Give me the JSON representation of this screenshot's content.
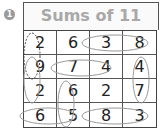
{
  "exercise": {
    "number": "1",
    "title": "Sums of 11"
  },
  "grid": {
    "rows": [
      [
        "2",
        "6",
        "3",
        "8"
      ],
      [
        "9",
        "7",
        "4",
        "4"
      ],
      [
        "2",
        "6",
        "2",
        "7"
      ],
      [
        "6",
        "5",
        "8",
        "3"
      ]
    ]
  },
  "pairs": [
    {
      "cells": [
        "r1c1",
        "r2c1"
      ],
      "values": [
        "2",
        "9"
      ],
      "style": "dashed"
    },
    {
      "cells": [
        "r1c3",
        "r1c4"
      ],
      "values": [
        "3",
        "8"
      ],
      "style": "solid"
    },
    {
      "cells": [
        "r2c2",
        "r2c3"
      ],
      "values": [
        "7",
        "4"
      ],
      "style": "solid"
    },
    {
      "cells": [
        "r2c4",
        "r3c4"
      ],
      "values": [
        "4",
        "7"
      ],
      "style": "solid"
    },
    {
      "cells": [
        "r3c1",
        "r4c1"
      ],
      "values": [
        "2",
        "9"
      ],
      "style": "solid"
    },
    {
      "cells": [
        "r3c2",
        "r4c2"
      ],
      "values": [
        "6",
        "5"
      ],
      "style": "solid"
    },
    {
      "cells": [
        "r4c1",
        "r4c2"
      ],
      "values": [
        "6",
        "5"
      ],
      "style": "solid"
    },
    {
      "cells": [
        "r4c3",
        "r4c4"
      ],
      "values": [
        "8",
        "3"
      ],
      "style": "solid"
    }
  ]
}
